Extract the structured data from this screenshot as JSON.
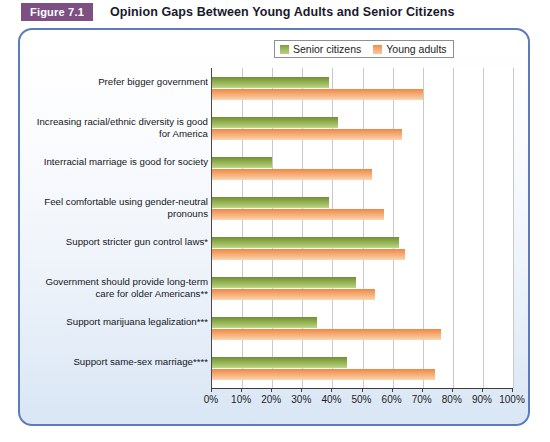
{
  "figure": {
    "badge": "Figure 7.1",
    "title": "Opinion Gaps Between Young Adults and Senior Citizens",
    "badge_color": "#7d4f82",
    "panel_border_color": "#5b7bbd"
  },
  "legend": {
    "position": "top-right",
    "items": [
      {
        "label": "Senior citizens",
        "color": "#8aa84c",
        "icon": "legend-swatch-green"
      },
      {
        "label": "Young adults",
        "color": "#f2a06a",
        "icon": "legend-swatch-orange"
      }
    ]
  },
  "chart_data": {
    "type": "bar",
    "orientation": "horizontal",
    "title": "Opinion Gaps Between Young Adults and Senior Citizens",
    "xlabel": "",
    "ylabel": "",
    "xlim": [
      0,
      100
    ],
    "xticks": [
      0,
      10,
      20,
      30,
      40,
      50,
      60,
      70,
      80,
      90,
      100
    ],
    "xticklabels": [
      "0%",
      "10%",
      "20%",
      "30%",
      "40%",
      "50%",
      "60%",
      "70%",
      "80%",
      "90%",
      "100%"
    ],
    "grid": true,
    "grid_axis": "x",
    "legend_position": "top-right",
    "categories": [
      "Prefer bigger government",
      "Increasing racial/ethnic diversity is good for America",
      "Interracial marriage is good for society",
      "Feel comfortable using gender-neutral pronouns",
      "Support stricter gun control laws*",
      "Government should provide long-term care for older Americans**",
      "Support marijuana legalization***",
      "Support same-sex marriage****"
    ],
    "series": [
      {
        "name": "Senior citizens",
        "color": "#8aa84c",
        "values": [
          39,
          42,
          20,
          39,
          62,
          48,
          35,
          45
        ]
      },
      {
        "name": "Young adults",
        "color": "#f2a06a",
        "values": [
          70,
          63,
          53,
          57,
          64,
          54,
          76,
          74
        ]
      }
    ]
  }
}
